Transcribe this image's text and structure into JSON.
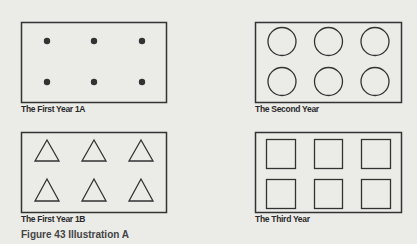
{
  "figure": {
    "caption": "Figure 43  Illustration A"
  },
  "panels": [
    {
      "id": "first-year-1a",
      "caption": "The First Year 1A",
      "shape": "dot",
      "rows": 2,
      "cols": 3
    },
    {
      "id": "second-year",
      "caption": "The Second Year",
      "shape": "circle",
      "rows": 2,
      "cols": 3
    },
    {
      "id": "first-year-1b",
      "caption": "The First Year 1B",
      "shape": "triangle",
      "rows": 2,
      "cols": 3
    },
    {
      "id": "third-year",
      "caption": "The Third Year",
      "shape": "square",
      "rows": 2,
      "cols": 3
    }
  ],
  "colors": {
    "background": "#ebebe8",
    "stroke": "#333333",
    "text": "#2a2a2a"
  }
}
